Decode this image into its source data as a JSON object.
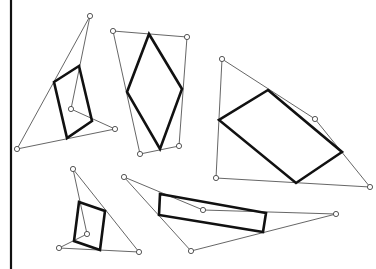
{
  "diagram": {
    "colors": {
      "background": "#ffffff",
      "thin_line": "#555555",
      "thick_line": "#111111"
    },
    "left_bar": {
      "x": 11,
      "y1": 0,
      "y2": 269
    },
    "figures": [
      {
        "name": "figure-1",
        "outline": [
          [
            90,
            16
          ],
          [
            115,
            129
          ],
          [
            71,
            109
          ],
          [
            17,
            149
          ]
        ],
        "outline_path": "M90,16 L17,149 L115,129 L71,109 L90,16",
        "inner": [
          [
            54,
            82
          ],
          [
            79,
            66
          ],
          [
            92,
            121
          ],
          [
            67,
            138
          ]
        ]
      },
      {
        "name": "figure-2",
        "outline": [
          [
            113,
            31
          ],
          [
            187,
            37
          ],
          [
            179,
            146
          ],
          [
            140,
            154
          ]
        ],
        "inner": [
          [
            149,
            34
          ],
          [
            182,
            89
          ],
          [
            160,
            149
          ],
          [
            127,
            92
          ]
        ]
      },
      {
        "name": "figure-3",
        "outline": [
          [
            222,
            59
          ],
          [
            315,
            119
          ],
          [
            370,
            187
          ],
          [
            216,
            178
          ]
        ],
        "inner": [
          [
            268,
            90
          ],
          [
            342,
            152
          ],
          [
            296,
            183
          ],
          [
            219,
            120
          ]
        ]
      },
      {
        "name": "figure-4",
        "outline": [
          [
            73,
            169
          ],
          [
            139,
            252
          ],
          [
            59,
            248
          ],
          [
            87,
            234
          ]
        ],
        "outline_path": "M73,169 L139,252 L59,248 L87,234 L73,169",
        "inner": [
          [
            79,
            202
          ],
          [
            105,
            211
          ],
          [
            100,
            250
          ],
          [
            74,
            241
          ]
        ]
      },
      {
        "name": "figure-5",
        "outline": [
          [
            124,
            177
          ],
          [
            203,
            210
          ],
          [
            336,
            214
          ],
          [
            191,
            251
          ]
        ],
        "outline_path": "M124,177 L203,210 L336,214 L191,251 Z",
        "inner": [
          [
            160,
            194
          ],
          [
            266,
            213
          ],
          [
            263,
            232
          ],
          [
            159,
            215
          ]
        ]
      }
    ],
    "stray_point": [
      216,
      178
    ]
  }
}
